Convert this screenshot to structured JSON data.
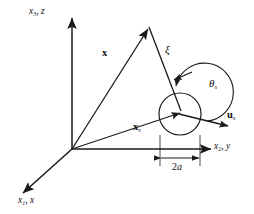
{
  "figure": {
    "background_color": "#ffffff",
    "stroke_color": "#1a1a1a",
    "text_color": "#111111"
  },
  "axes": {
    "vertical": {
      "name": "vertical-axis",
      "label_base": "x",
      "label_sub": "3",
      "label_alt": "z",
      "label_full": "x3, z"
    },
    "horizontal": {
      "name": "horizontal-axis",
      "label_base": "x",
      "label_sub": "2",
      "label_alt": "y",
      "label_full": "x2, y"
    },
    "depth": {
      "name": "depth-axis",
      "label_base": "x",
      "label_sub": "1",
      "label_alt": "x",
      "label_full": "x1, x"
    }
  },
  "vectors": {
    "x_field": {
      "name": "field-point-vector",
      "label_base": "x",
      "label_sub": "",
      "bold": true
    },
    "x_source": {
      "name": "source-point-vector",
      "label_base": "x",
      "label_sub": "s",
      "bold": true
    },
    "u_source": {
      "name": "source-direction-vector",
      "label_base": "u",
      "label_sub": "s",
      "bold": true
    },
    "xi": {
      "name": "separation-vector",
      "label_base": "ξ",
      "label_sub": "",
      "bold": false
    }
  },
  "angles": {
    "theta_s": {
      "name": "scattering-angle",
      "label_base": "θ",
      "label_sub": "s"
    }
  },
  "dimensions": {
    "diameter": {
      "name": "aperture-diameter",
      "label": "2a",
      "label_number": "2",
      "label_symbol": "a"
    }
  },
  "elements": {
    "scatterer_circle": "scatterer-circle",
    "origin": "origin-point",
    "arc_arrow": "angle-arc-arrow",
    "dimension_line": "dimension-line"
  }
}
